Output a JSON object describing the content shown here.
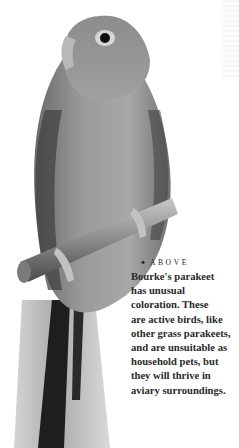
{
  "photo": {
    "subject": "Bourke's parakeet perched on a branch",
    "tone": "grayscale"
  },
  "caption": {
    "bullet_icon": "✦",
    "label": "ABOVE",
    "text": "Bourke's parakeet\nhas unusual\ncoloration. These\nare active birds, like\nother grass parakeets,\nand are unsuitable as\nhousehold pets, but\nthey will thrive in\naviary surroundings."
  }
}
